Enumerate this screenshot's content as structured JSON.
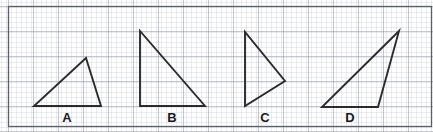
{
  "page": {
    "width": 433,
    "height": 132,
    "background_color": "#ffffff"
  },
  "grid": {
    "minor_spacing": 5,
    "major_spacing": 25,
    "minor_color": "#b9bfcb",
    "major_color": "#8d94a3",
    "border_color": "#5a5f68",
    "origin_x": 8,
    "origin_y": 6,
    "right": 431,
    "bottom": 126
  },
  "figures": {
    "stroke_color": "#2b2b2b",
    "stroke_width": 1.9,
    "items": [
      {
        "label": "A",
        "name": "triangle-a",
        "description": "scalene triangle, horizontal base, apex upper right",
        "points": "34,106 101,106 86,58",
        "label_x": 67,
        "label_y": 122
      },
      {
        "label": "B",
        "name": "triangle-b",
        "description": "right triangle, right angle at bottom left",
        "points": "140,106 140,31 205,106",
        "label_x": 172,
        "label_y": 122
      },
      {
        "label": "C",
        "name": "triangle-c",
        "description": "triangle with vertical left side, apex pointing right",
        "points": "245,32 245,106 285,81",
        "label_x": 265,
        "label_y": 122
      },
      {
        "label": "D",
        "name": "triangle-d",
        "description": "slender triangle, horizontal base, apex far upper right",
        "points": "322,107 378,107 399,31",
        "label_x": 350,
        "label_y": 122
      }
    ]
  }
}
